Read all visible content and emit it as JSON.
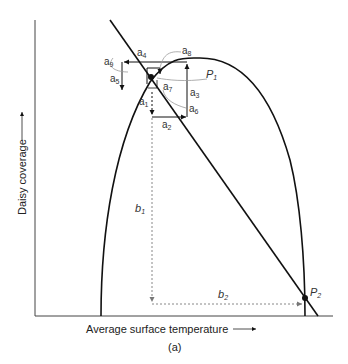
{
  "figure": {
    "caption": "(a)",
    "x_axis_label": "Average surface temperature",
    "y_axis_label": "Daisy coverage",
    "points": [
      {
        "name": "P",
        "sub": "1"
      },
      {
        "name": "P",
        "sub": "2"
      }
    ],
    "arrow_labels": [
      {
        "name": "a",
        "sub": "1"
      },
      {
        "name": "a",
        "sub": "2"
      },
      {
        "name": "a",
        "sub": "3"
      },
      {
        "name": "a",
        "sub": "4"
      },
      {
        "name": "a",
        "sub": "5"
      },
      {
        "name": "a",
        "sub": "6"
      },
      {
        "name": "a",
        "sub": "7"
      },
      {
        "name": "a",
        "sub": "8"
      },
      {
        "name": "a",
        "sub": "9"
      }
    ],
    "dashed_labels": [
      {
        "name": "b",
        "sub": "1"
      },
      {
        "name": "b",
        "sub": "2"
      }
    ],
    "colors": {
      "curve": "#111111",
      "leader": "#999999",
      "dashed": "#888888"
    }
  }
}
